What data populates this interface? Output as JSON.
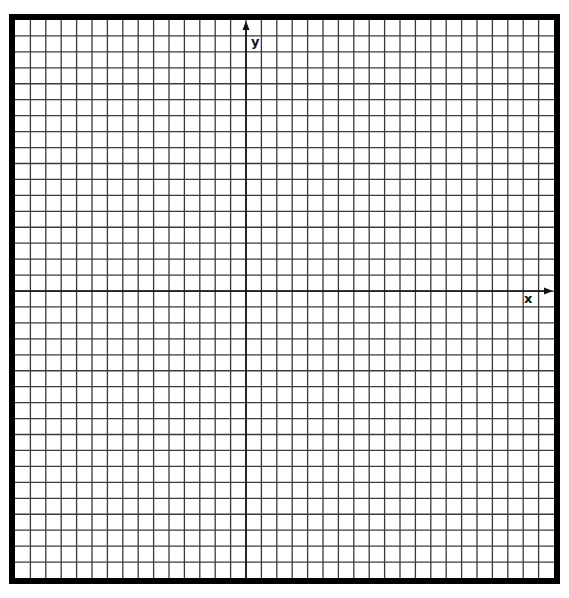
{
  "diagram": {
    "type": "coordinate-grid",
    "frame": {
      "outer_left": 9,
      "outer_top": 14,
      "outer_right": 560,
      "outer_bottom": 584,
      "border_width": 6,
      "color": "#000000"
    },
    "grid": {
      "columns": 35,
      "rows": 35,
      "line_color": "#3a3a3a",
      "line_width": 1.3
    },
    "axes": {
      "y_axis_column": 15,
      "x_axis_row": 17,
      "color": "#111111",
      "x_label": "x",
      "y_label": "y",
      "arrows": true
    }
  }
}
